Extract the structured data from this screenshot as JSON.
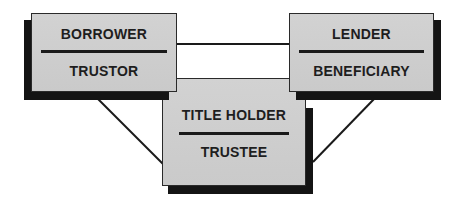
{
  "diagram": {
    "type": "relationship triangle (deed of trust parties)",
    "nodes": [
      {
        "id": "borrower",
        "primary": "BORROWER",
        "secondary": "TRUSTOR"
      },
      {
        "id": "lender",
        "primary": "LENDER",
        "secondary": "BENEFICIARY"
      },
      {
        "id": "title_holder",
        "primary": "TITLE HOLDER",
        "secondary": "TRUSTEE"
      }
    ],
    "edges": [
      {
        "from": "borrower",
        "to": "lender"
      },
      {
        "from": "borrower",
        "to": "title_holder"
      },
      {
        "from": "lender",
        "to": "title_holder"
      }
    ],
    "colors": {
      "box_fill": "#cecece",
      "shadow": "#141414",
      "line": "#1a1a1a",
      "text": "#1e1e1e"
    }
  }
}
